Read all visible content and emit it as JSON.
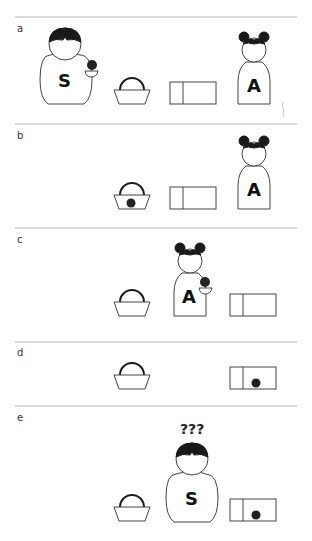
{
  "figure": {
    "type": "Sally-Anne false-belief test illustration",
    "panels": [
      {
        "label": "a",
        "description": "S holds marble beside basket and box; A watches"
      },
      {
        "label": "b",
        "description": "Marble placed in basket; S has left; A remains"
      },
      {
        "label": "c",
        "description": "A takes marble out of basket"
      },
      {
        "label": "d",
        "description": "Marble is now in the box"
      },
      {
        "label": "e",
        "description": "S returns and wonders where the marble is"
      }
    ],
    "characters": {
      "sally_letter": "S",
      "anne_letter": "A"
    },
    "thought": "???",
    "colors": {
      "line": "#444444",
      "hair": "#1a1a1a",
      "separator": "#b5b5b5",
      "background": "#ffffff"
    }
  }
}
